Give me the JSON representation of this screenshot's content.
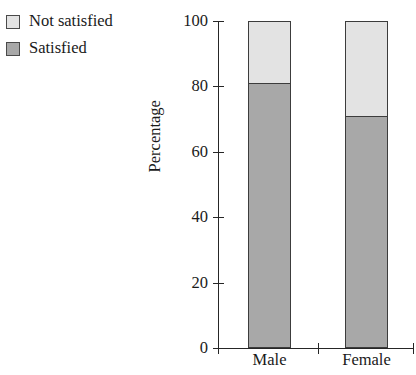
{
  "chart_data": {
    "type": "bar",
    "stacked": true,
    "title": "",
    "subtitle": "",
    "xlabel": "",
    "ylabel": "Percentage",
    "categories": [
      "Male",
      "Female"
    ],
    "series": [
      {
        "name": "Satisfied",
        "values": [
          81,
          71
        ],
        "color": "#a8a8a8"
      },
      {
        "name": "Not satisfied",
        "values": [
          19,
          29
        ],
        "color": "#e3e3e3"
      }
    ],
    "ylim": [
      0,
      100
    ],
    "yticks": [
      0,
      20,
      40,
      60,
      80,
      100
    ],
    "ytick_labels": [
      "0",
      "20",
      "40",
      "60",
      "80",
      "100"
    ],
    "grid": false,
    "legend_position": "top-left",
    "legend_order": [
      "Not satisfied",
      "Satisfied"
    ]
  },
  "legend": {
    "items": [
      {
        "label": "Not satisfied",
        "color": "#e3e3e3"
      },
      {
        "label": "Satisfied",
        "color": "#a8a8a8"
      }
    ]
  },
  "axes": {
    "y_title": "Percentage",
    "y_tick_labels": [
      "100",
      "80",
      "60",
      "40",
      "20",
      "0"
    ],
    "x_tick_labels": [
      "Male",
      "Female"
    ]
  },
  "colors": {
    "not_satisfied": "#e3e3e3",
    "satisfied": "#a8a8a8",
    "axis": "#262626",
    "bar_border": "#3c3c3c",
    "text": "#1a1a1a",
    "background": "#ffffff"
  }
}
